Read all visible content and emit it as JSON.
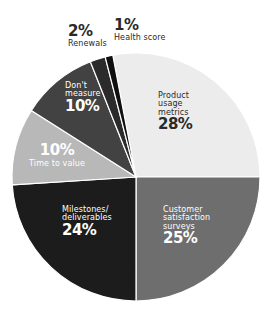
{
  "chart_data": {
    "type": "pie",
    "title": "",
    "start_angle_deg": -10.8,
    "direction": "clockwise",
    "categories": [
      "Product usage metrics",
      "Customer satisfaction surveys",
      "Milestones/ deliverables",
      "Time to value",
      "Don't measure",
      "Renewals",
      "Health score"
    ],
    "values": [
      28,
      25,
      24,
      10,
      10,
      2,
      1
    ],
    "colors": [
      "#ececec",
      "#6e6e6e",
      "#1c1c1c",
      "#b8b8b8",
      "#424242",
      "#2b2b2b",
      "#101010"
    ],
    "unit": "%"
  },
  "labels": {
    "product": {
      "name_lines": [
        "Product",
        "usage",
        "metrics"
      ],
      "pct": "28%"
    },
    "customer": {
      "name_lines": [
        "Customer",
        "satisfaction",
        "surveys"
      ],
      "pct": "25%"
    },
    "milestones": {
      "name_lines": [
        "Milestones/",
        "deliverables"
      ],
      "pct": "24%"
    },
    "time": {
      "name": "Time to value",
      "pct": "10%"
    },
    "dont": {
      "name_lines": [
        "Don't",
        "measure"
      ],
      "pct": "10%"
    },
    "renewals": {
      "name": "Renewals",
      "pct": "2%"
    },
    "health": {
      "name": "Health score",
      "pct": "1%"
    }
  }
}
